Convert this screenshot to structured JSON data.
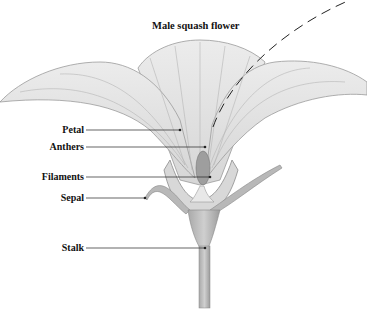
{
  "diagram": {
    "title": "Male squash flower",
    "labels": [
      {
        "text": "Petal",
        "target": "petal"
      },
      {
        "text": "Anthers",
        "target": "anthers"
      },
      {
        "text": "Filaments",
        "target": "filaments"
      },
      {
        "text": "Sepal",
        "target": "sepal"
      },
      {
        "text": "Stalk",
        "target": "stalk"
      }
    ]
  }
}
